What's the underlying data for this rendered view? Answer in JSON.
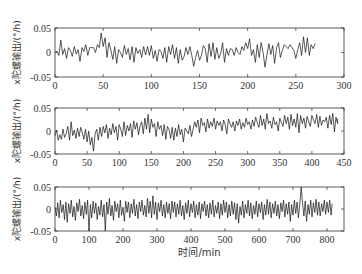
{
  "chart_data": [
    {
      "type": "line",
      "title": "",
      "xlabel": "",
      "ylabel": "x陀螺输出/(°/h)",
      "xlim": [
        0,
        300
      ],
      "ylim": [
        -0.05,
        0.05
      ],
      "xticks": [
        0,
        50,
        100,
        150,
        200,
        250,
        300
      ],
      "yticks": [
        -0.05,
        0,
        0.05
      ],
      "ytick_labels": [
        "-0.05",
        "0",
        "0.05"
      ],
      "grid": false,
      "series": [
        {
          "name": "x gyro output run 1",
          "x_end": 278,
          "step": 2,
          "values": [
            0.0,
            0.003,
            -0.006,
            0.025,
            -0.004,
            0.008,
            -0.012,
            0.01,
            0.004,
            -0.008,
            0.012,
            -0.003,
            0.006,
            -0.018,
            0.01,
            0.002,
            0.016,
            -0.006,
            0.01,
            0.01,
            0.01,
            0.0,
            0.016,
            0.01,
            0.04,
            0.012,
            0.03,
            -0.01,
            0.02,
            0.005,
            -0.014,
            0.012,
            -0.022,
            0.006,
            0.0,
            -0.01,
            0.014,
            -0.004,
            0.008,
            -0.015,
            0.012,
            -0.02,
            0.01,
            -0.002,
            0.006,
            -0.01,
            0.012,
            -0.005,
            0.012,
            -0.006,
            0.014,
            -0.012,
            0.004,
            -0.018,
            0.006,
            0.002,
            -0.012,
            0.01,
            -0.02,
            0.012,
            -0.004,
            0.016,
            -0.012,
            0.01,
            -0.022,
            0.006,
            -0.016,
            -0.008,
            0.01,
            -0.004,
            0.012,
            -0.006,
            -0.028,
            -0.01,
            0.004,
            -0.016,
            -0.006,
            0.014,
            0.008,
            -0.02,
            0.018,
            -0.008,
            0.02,
            -0.014,
            0.01,
            -0.012,
            -0.002,
            0.02,
            -0.02,
            0.008,
            -0.006,
            0.008,
            0.006,
            -0.006,
            0.01,
            0.0,
            -0.004,
            0.012,
            0.004,
            0.02,
            0.008,
            0.028,
            -0.006,
            0.006,
            -0.02,
            0.016,
            -0.01,
            0.02,
            0.0,
            -0.03,
            -0.006,
            0.018,
            -0.004,
            0.014,
            -0.022,
            0.01,
            0.02,
            -0.01,
            0.004,
            0.016,
            0.012,
            0.008,
            0.016,
            0.01,
            0.004,
            -0.012,
            0.006,
            0.02,
            -0.006,
            0.032,
            0.0,
            0.03,
            -0.006,
            0.016,
            0.008,
            0.018
          ]
        }
      ]
    },
    {
      "type": "line",
      "title": "",
      "xlabel": "",
      "ylabel": "x陀螺输出/(°/h)",
      "xlim": [
        0,
        450
      ],
      "ylim": [
        -0.05,
        0.05
      ],
      "xticks": [
        0,
        50,
        100,
        150,
        200,
        250,
        300,
        350,
        400,
        450
      ],
      "yticks": [
        -0.05,
        0,
        0.05
      ],
      "ytick_labels": [
        "-0.05",
        "0",
        "0.05"
      ],
      "grid": false,
      "series": [
        {
          "name": "x gyro output run 2",
          "x_end": 440,
          "step": 2.5,
          "values": [
            -0.01,
            0.002,
            -0.02,
            -0.008,
            -0.018,
            0.004,
            -0.014,
            -0.006,
            0.01,
            -0.02,
            0.02,
            -0.01,
            0.002,
            -0.016,
            0.006,
            -0.012,
            0.008,
            -0.004,
            -0.018,
            0.004,
            -0.024,
            0.0,
            -0.03,
            -0.014,
            -0.044,
            -0.006,
            0.004,
            -0.02,
            0.008,
            -0.012,
            0.01,
            -0.004,
            0.014,
            -0.016,
            0.006,
            -0.008,
            0.016,
            -0.004,
            0.01,
            -0.02,
            0.014,
            0.004,
            -0.012,
            0.02,
            -0.01,
            0.012,
            0.0,
            0.016,
            -0.014,
            0.022,
            0.004,
            0.018,
            -0.008,
            0.012,
            0.02,
            -0.006,
            0.028,
            0.004,
            0.036,
            -0.004,
            0.026,
            0.008,
            0.016,
            -0.012,
            0.02,
            0.004,
            0.012,
            -0.01,
            0.014,
            -0.018,
            0.01,
            0.004,
            -0.016,
            0.008,
            -0.02,
            0.006,
            -0.012,
            0.014,
            -0.008,
            0.004,
            -0.024,
            0.006,
            0.0,
            -0.006,
            0.012,
            -0.012,
            0.004,
            0.02,
            0.008,
            0.024,
            -0.004,
            0.028,
            0.012,
            0.018,
            -0.002,
            0.026,
            0.006,
            0.02,
            0.01,
            0.028,
            0.004,
            0.022,
            0.012,
            0.02,
            0.0,
            0.024,
            0.014,
            -0.006,
            0.026,
            0.016,
            0.008,
            0.02,
            0.0,
            0.022,
            0.012,
            0.026,
            0.004,
            0.018,
            0.008,
            0.028,
            0.014,
            0.02,
            0.004,
            0.024,
            0.01,
            0.03,
            0.018,
            0.008,
            0.034,
            0.012,
            0.026,
            0.004,
            0.038,
            0.016,
            0.022,
            0.006,
            0.03,
            0.014,
            0.02,
            0.0,
            0.028,
            0.018,
            0.01,
            0.034,
            0.016,
            0.03,
            0.004,
            0.036,
            0.012,
            0.026,
            0.008,
            0.038,
            -0.004,
            0.034,
            0.016,
            0.028,
            0.006,
            0.032,
            0.02,
            0.01,
            0.034,
            0.024,
            0.016,
            0.036,
            0.008,
            0.032,
            0.012,
            0.024,
            0.02,
            0.03,
            0.006,
            0.034,
            0.014,
            0.038,
            -0.002,
            0.03,
            0.016,
            0.026
          ]
        }
      ]
    },
    {
      "type": "line",
      "title": "",
      "xlabel": "时间/min",
      "ylabel": "x陀螺输出/(°/h)",
      "xlim": [
        0,
        850
      ],
      "ylim": [
        -0.05,
        0.05
      ],
      "xticks": [
        0,
        100,
        200,
        300,
        400,
        500,
        600,
        700,
        800
      ],
      "yticks": [
        -0.05,
        0,
        0.05
      ],
      "ytick_labels": [
        "-0.05",
        "0",
        "0.05"
      ],
      "grid": false,
      "series": [
        {
          "name": "x gyro output run 3",
          "x_end": 815,
          "step": 4,
          "values": [
            0.004,
            -0.016,
            0.014,
            -0.02,
            0.02,
            -0.008,
            0.01,
            -0.024,
            0.016,
            -0.03,
            0.012,
            -0.01,
            0.02,
            -0.018,
            0.006,
            -0.026,
            0.014,
            -0.006,
            0.022,
            -0.016,
            0.008,
            -0.022,
            0.016,
            -0.012,
            0.02,
            -0.058,
            0.01,
            -0.02,
            0.018,
            -0.01,
            0.014,
            -0.024,
            0.006,
            -0.014,
            0.02,
            -0.018,
            0.01,
            -0.058,
            0.016,
            -0.012,
            0.024,
            -0.016,
            0.008,
            -0.026,
            0.018,
            -0.006,
            0.012,
            -0.02,
            0.02,
            -0.014,
            0.004,
            -0.028,
            0.018,
            -0.008,
            0.016,
            -0.02,
            0.012,
            -0.01,
            0.022,
            -0.016,
            0.01,
            -0.022,
            0.016,
            -0.006,
            0.02,
            -0.014,
            0.008,
            -0.018,
            0.024,
            -0.01,
            0.018,
            -0.02,
            0.03,
            -0.012,
            0.016,
            -0.024,
            0.014,
            -0.006,
            0.02,
            -0.016,
            0.01,
            -0.02,
            0.016,
            -0.01,
            0.012,
            -0.022,
            0.018,
            -0.008,
            0.016,
            -0.018,
            0.012,
            -0.012,
            0.02,
            -0.016,
            0.008,
            -0.024,
            0.014,
            -0.01,
            0.02,
            -0.018,
            0.012,
            -0.008,
            0.018,
            -0.02,
            0.01,
            -0.014,
            0.016,
            -0.022,
            0.012,
            -0.006,
            0.018,
            -0.016,
            0.01,
            -0.02,
            0.014,
            -0.012,
            0.02,
            -0.018,
            0.008,
            -0.01,
            0.016,
            -0.022,
            0.012,
            -0.014,
            0.02,
            -0.008,
            0.016,
            -0.02,
            0.01,
            -0.016,
            0.018,
            -0.012,
            0.014,
            -0.024,
            0.012,
            -0.032,
            0.006,
            -0.014,
            0.018,
            -0.02,
            0.01,
            -0.01,
            0.02,
            -0.016,
            0.014,
            -0.022,
            0.008,
            -0.012,
            0.018,
            -0.018,
            0.012,
            -0.008,
            0.016,
            -0.024,
            0.01,
            -0.014,
            0.022,
            -0.012,
            0.016,
            -0.02,
            0.012,
            -0.01,
            0.018,
            -0.016,
            0.01,
            -0.022,
            0.014,
            -0.006,
            0.02,
            -0.018,
            0.012,
            -0.012,
            0.016,
            -0.028,
            0.01,
            -0.014,
            0.02,
            -0.01,
            0.016,
            -0.02,
            0.012,
            0.06,
            0.014,
            -0.016,
            0.018,
            -0.028,
            0.01,
            -0.012,
            0.02,
            -0.018,
            0.014,
            -0.008,
            0.022,
            -0.014,
            0.016,
            -0.016,
            0.012,
            -0.006,
            0.02,
            -0.012,
            0.016,
            -0.008,
            0.02,
            -0.014,
            0.012
          ]
        }
      ]
    }
  ]
}
